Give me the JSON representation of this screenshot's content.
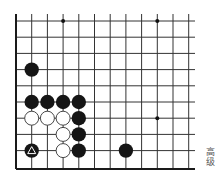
{
  "board": {
    "origin_x": 16,
    "spacing_x": 15.7,
    "top_y": 21,
    "spacing_y": 16.2,
    "columns": 12,
    "rows": 10,
    "left_edge_x": 16,
    "bottom_edge_y": 169,
    "line_top": 14,
    "line_right": 195,
    "line_color": "#333333",
    "edge_color": "#1a1a1a"
  },
  "star_points": [
    {
      "col": 3,
      "row": 0
    },
    {
      "col": 9,
      "row": 0
    },
    {
      "col": 9,
      "row": 6
    }
  ],
  "stones": [
    {
      "color": "black",
      "col": 1,
      "row": 3
    },
    {
      "color": "black",
      "col": 1,
      "row": 5
    },
    {
      "color": "black",
      "col": 2,
      "row": 5
    },
    {
      "color": "black",
      "col": 3,
      "row": 5
    },
    {
      "color": "black",
      "col": 4,
      "row": 5
    },
    {
      "color": "white",
      "col": 1,
      "row": 6
    },
    {
      "color": "white",
      "col": 2,
      "row": 6
    },
    {
      "color": "white",
      "col": 3,
      "row": 6
    },
    {
      "color": "black",
      "col": 4,
      "row": 6
    },
    {
      "color": "white",
      "col": 3,
      "row": 7
    },
    {
      "color": "black",
      "col": 4,
      "row": 7
    },
    {
      "color": "black",
      "col": 1,
      "row": 8,
      "marker": "triangle"
    },
    {
      "color": "white",
      "col": 3,
      "row": 8
    },
    {
      "color": "black",
      "col": 4,
      "row": 8
    },
    {
      "color": "black",
      "col": 7,
      "row": 8
    }
  ],
  "caption": "高级"
}
